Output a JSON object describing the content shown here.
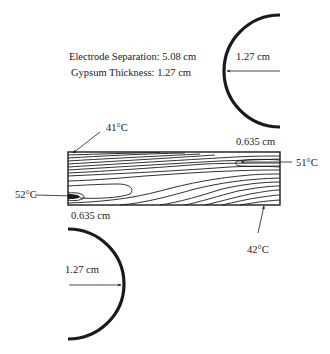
{
  "diagram": {
    "info": {
      "electrode_separation": "Electrode Separation: 5.08 cm",
      "gypsum_thickness": "Gypsum Thickness: 1.27 cm"
    },
    "electrodes": {
      "top_right": {
        "radius_label": "1.27 cm"
      },
      "bottom_left": {
        "radius_label": "1.27 cm"
      }
    },
    "specimen": {
      "offset_top_right_label": "0.635 cm",
      "offset_bottom_left_label": "0.635 cm"
    },
    "temperatures": {
      "top_left": "41°C",
      "right_hotspot": "51°C",
      "left_hotspot": "52°C",
      "bottom_right": "42°C"
    },
    "colors": {
      "line": "#1a1a1a",
      "background": "#ffffff"
    }
  }
}
